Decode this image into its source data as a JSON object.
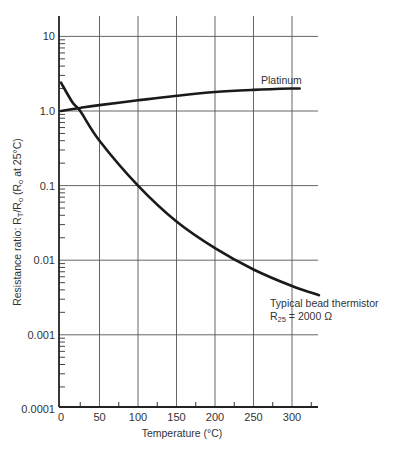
{
  "chart_data": {
    "type": "line",
    "title": "",
    "xlabel": "Temperature (°C)",
    "ylabel": "Resistance ratio: R_T / R_o (R_o at 25°C)",
    "xlim": [
      0,
      335
    ],
    "ylim": [
      0.0001,
      20
    ],
    "yscale": "log",
    "grid": true,
    "x_ticks": [
      "0",
      "50",
      "100",
      "150",
      "200",
      "250",
      "300"
    ],
    "y_ticks": [
      "10",
      "1.0",
      "0.1",
      "0.01",
      "0.001",
      "0.0001"
    ],
    "series": [
      {
        "name": "Platinum",
        "x": [
          0,
          25,
          50,
          100,
          150,
          200,
          250,
          300,
          310
        ],
        "y": [
          1.0,
          1.1,
          1.2,
          1.39,
          1.6,
          1.8,
          1.92,
          2.0,
          2.0
        ]
      },
      {
        "name": "Typical bead thermistor R25 = 2000 Ω",
        "x": [
          0,
          15,
          25,
          50,
          100,
          150,
          200,
          250,
          300,
          335
        ],
        "y": [
          2.4,
          1.3,
          1.0,
          0.4,
          0.1,
          0.033,
          0.0145,
          0.0075,
          0.0045,
          0.0034
        ]
      }
    ],
    "annotations": [
      "Platinum",
      "Typical bead thermistor",
      "R25 = 2000 Ω"
    ]
  },
  "labels": {
    "xlabel": "Temperature (°C)",
    "ylabel_main": "Resistance ratio: R",
    "ylabel_sub_t": "T",
    "ylabel_mid": "/R",
    "ylabel_sub_o": "o",
    "ylabel_paren": " (R",
    "ylabel_sub_o2": "o",
    "ylabel_end": " at 25°C)",
    "platinum": "Platinum",
    "thermistor_line1": "Typical bead thermistor",
    "thermistor_r": "R",
    "thermistor_sub": "25",
    "thermistor_val": " = 2000 Ω"
  }
}
